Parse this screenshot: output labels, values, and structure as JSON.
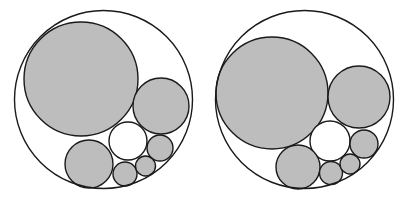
{
  "colors": {
    "background": "#ffffff",
    "stroke": "#1a1a1a",
    "gray_fill": "#bdbdbd",
    "white_fill": "#ffffff"
  },
  "figures": [
    {
      "name": "left-packing",
      "outer": {
        "cx": 103.5,
        "cy": 99.5,
        "r": 89
      },
      "circles": [
        {
          "cx": 81,
          "cy": 79,
          "r": 57,
          "fill": "gray"
        },
        {
          "cx": 161,
          "cy": 106,
          "r": 28,
          "fill": "gray"
        },
        {
          "cx": 128,
          "cy": 141,
          "r": 19,
          "fill": "white"
        },
        {
          "cx": 89,
          "cy": 164,
          "r": 24,
          "fill": "gray"
        },
        {
          "cx": 160,
          "cy": 148,
          "r": 13,
          "fill": "gray"
        },
        {
          "cx": 125,
          "cy": 174,
          "r": 12,
          "fill": "gray"
        },
        {
          "cx": 145.5,
          "cy": 166,
          "r": 10,
          "fill": "gray"
        }
      ]
    },
    {
      "name": "right-packing",
      "outer": {
        "cx": 304.5,
        "cy": 99.5,
        "r": 89
      },
      "circles": [
        {
          "cx": 272,
          "cy": 93,
          "r": 56,
          "fill": "gray"
        },
        {
          "cx": 359,
          "cy": 97,
          "r": 31,
          "fill": "gray"
        },
        {
          "cx": 330,
          "cy": 141,
          "r": 20,
          "fill": "white"
        },
        {
          "cx": 298,
          "cy": 167,
          "r": 22,
          "fill": "gray"
        },
        {
          "cx": 364,
          "cy": 144,
          "r": 14,
          "fill": "gray"
        },
        {
          "cx": 331,
          "cy": 173,
          "r": 11.5,
          "fill": "gray"
        },
        {
          "cx": 350,
          "cy": 164,
          "r": 10,
          "fill": "gray"
        }
      ]
    }
  ]
}
